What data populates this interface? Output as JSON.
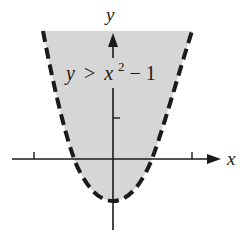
{
  "graph": {
    "x_axis_label": "x",
    "y_axis_label": "y",
    "inequality": {
      "lhs": "y",
      "op": ">",
      "base": "x",
      "exp": "2",
      "rest": " − 1"
    },
    "boundary_style": "dashed",
    "shade_color": "#d6d6d6",
    "line_color": "#1a1a1a"
  }
}
